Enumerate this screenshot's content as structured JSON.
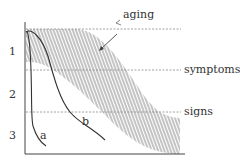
{
  "diagram": {
    "title": "",
    "y_labels": [
      "1",
      "2",
      "3"
    ],
    "thresholds": [
      {
        "name": "top",
        "label": ""
      },
      {
        "name": "symptoms",
        "label": "symptoms"
      },
      {
        "name": "signs",
        "label": "signs"
      }
    ],
    "band_label": "aging",
    "curves": [
      {
        "id": "a",
        "label": "a"
      },
      {
        "id": "b",
        "label": "b"
      }
    ],
    "colors": {
      "ink": "#333333",
      "dashed": "#888888",
      "hatch": "#555555"
    }
  }
}
